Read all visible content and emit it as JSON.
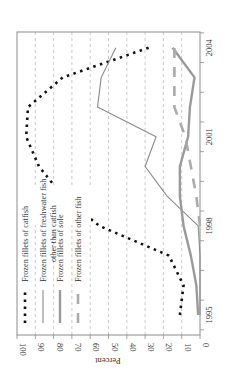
{
  "chart_data": {
    "type": "line",
    "orientation": "rotated-90-counterclockwise",
    "title": "",
    "xlabel": "",
    "ylabel": "Percent",
    "x": [
      1995,
      1996,
      1997,
      1998,
      1999,
      2000,
      2001,
      2002,
      2003,
      2004
    ],
    "x_tick_labels": [
      "1995",
      "1998",
      "2001",
      "2004"
    ],
    "y_ticks": [
      0,
      10,
      20,
      30,
      40,
      50,
      60,
      70,
      80,
      90,
      100
    ],
    "ylim": [
      0,
      100
    ],
    "grid": "dashed horizontal gridlines at each 10%",
    "legend_position": "inside plot, lower-left (unrotated: upper-left)",
    "series": [
      {
        "name": "Frozen fillets of catfish",
        "style": "dotted-black-thick",
        "color": "#111111",
        "values": [
          11,
          9,
          17,
          55,
          75,
          88,
          95,
          94,
          75,
          28
        ]
      },
      {
        "name": "Frozen fillets of freshwater fish other than catfish",
        "style": "solid-gray-thin",
        "color": "#8a8a8a",
        "values": [
          0,
          0,
          0,
          1,
          18,
          30,
          24,
          56,
          54,
          46
        ]
      },
      {
        "name": "Frozen fillets of sole",
        "style": "solid-gray-thick",
        "color": "#9a9a9a",
        "values": [
          1,
          2,
          5,
          9,
          11,
          11,
          6.5,
          5.5,
          3,
          15
        ]
      },
      {
        "name": "Frozen fillets of other fish",
        "style": "dashed-gray-thick",
        "color": "#a8a8a8",
        "values": [
          null,
          null,
          null,
          0,
          2,
          5,
          8,
          14,
          14,
          14
        ]
      }
    ]
  },
  "axes": {
    "value_axis_label": "Percent",
    "value_tick_labels": [
      "100",
      "90",
      "80",
      "70",
      "60",
      "50",
      "40",
      "30",
      "20",
      "10",
      "0"
    ],
    "year_tick_labels": [
      "1995",
      "1998",
      "2001",
      "2004"
    ]
  },
  "legend": {
    "items": [
      {
        "label": "Frozen fillets of catfish"
      },
      {
        "label_line1": "Frozen fillets of freshwater fish",
        "label_line2": "other than catfish"
      },
      {
        "label": "Frozen fillets of sole"
      },
      {
        "label": "Frozen fillets of other fish"
      }
    ]
  }
}
